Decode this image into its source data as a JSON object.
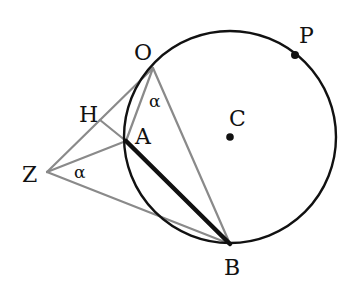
{
  "diagram": {
    "type": "geometry",
    "colors": {
      "circle": "#111111",
      "chord_AB": "#111111",
      "construction": "#8a8a8a",
      "background": "#ffffff"
    },
    "circle": {
      "center": "C",
      "cx": 230,
      "cy": 137,
      "r": 106
    },
    "points": {
      "O": {
        "x": 153,
        "y": 68,
        "label": "O"
      },
      "A": {
        "x": 126,
        "y": 141,
        "label": "A"
      },
      "B": {
        "x": 230,
        "y": 244,
        "label": "B"
      },
      "P": {
        "x": 295,
        "y": 55,
        "label": "P"
      },
      "C": {
        "x": 230,
        "y": 137,
        "label": "C"
      },
      "H": {
        "x": 100,
        "y": 120,
        "label": "H"
      },
      "Z": {
        "x": 47,
        "y": 172,
        "label": "Z"
      }
    },
    "segments": [
      {
        "from": "O",
        "to": "A",
        "style": "construction"
      },
      {
        "from": "O",
        "to": "B",
        "style": "construction"
      },
      {
        "from": "O",
        "to": "Z",
        "style": "construction"
      },
      {
        "from": "H",
        "to": "A",
        "style": "construction"
      },
      {
        "from": "Z",
        "to": "A",
        "style": "construction"
      },
      {
        "from": "Z",
        "to": "B",
        "style": "construction"
      },
      {
        "from": "A",
        "to": "B",
        "style": "bold"
      }
    ],
    "angles": [
      {
        "vertex": "O",
        "label": "α"
      },
      {
        "vertex": "Z",
        "label": "α"
      }
    ]
  }
}
